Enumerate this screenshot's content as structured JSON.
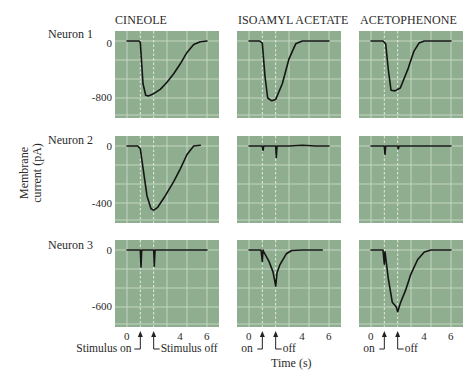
{
  "chart_data": {
    "type": "line",
    "title": "",
    "xlabel": "Time (s)",
    "ylabel": "Membrane current (pA)",
    "grid": true,
    "panel_background": "#8fae8f",
    "grid_color": "#c8d9c6",
    "trace_color": "#151515",
    "columns": [
      "CINEOLE",
      "ISOAMYL ACETATE",
      "ACETOPHENONE"
    ],
    "rows": [
      {
        "label": "Neuron 1",
        "yticks": [
          "0",
          "-800"
        ],
        "ylim": [
          -1000,
          100
        ]
      },
      {
        "label": "Neuron 2",
        "yticks": [
          "0",
          "-400"
        ],
        "ylim": [
          -500,
          50
        ]
      },
      {
        "label": "Neuron 3",
        "yticks": [
          "0",
          "-600"
        ],
        "ylim": [
          -750,
          75
        ]
      }
    ],
    "xticks": [
      "0",
      "4",
      "6"
    ],
    "xlim": [
      0,
      6.5
    ],
    "stimulus": {
      "on_s": 1.0,
      "off_s": 2.0
    },
    "panels": [
      {
        "row": "Neuron 1",
        "odor": "CINEOLE",
        "peak_pA": -760,
        "x": [
          0,
          0.9,
          1.0,
          1.2,
          1.4,
          1.6,
          2.0,
          2.5,
          3.0,
          3.5,
          4.0,
          4.5,
          5.0,
          5.5,
          6.0
        ],
        "y": [
          0,
          0,
          -20,
          -600,
          -760,
          -770,
          -740,
          -680,
          -580,
          -460,
          -320,
          -160,
          -50,
          -10,
          0
        ]
      },
      {
        "row": "Neuron 1",
        "odor": "ISOAMYL ACETATE",
        "peak_pA": -840,
        "x": [
          0,
          0.8,
          1.0,
          1.2,
          1.4,
          1.7,
          2.0,
          2.5,
          3.0,
          3.5,
          4.0,
          5.0,
          6.0
        ],
        "y": [
          0,
          0,
          -30,
          -500,
          -800,
          -840,
          -820,
          -600,
          -250,
          -40,
          0,
          0,
          0
        ]
      },
      {
        "row": "Neuron 1",
        "odor": "ACETOPHENONE",
        "peak_pA": -700,
        "x": [
          0,
          0.9,
          1.1,
          1.3,
          1.5,
          1.8,
          2.2,
          2.8,
          3.2,
          3.6,
          4.0,
          5.0,
          6.0
        ],
        "y": [
          0,
          0,
          -40,
          -400,
          -690,
          -700,
          -660,
          -380,
          -150,
          -30,
          0,
          0,
          0
        ]
      },
      {
        "row": "Neuron 2",
        "odor": "CINEOLE",
        "peak_pA": -450,
        "x": [
          0,
          0.8,
          1.0,
          1.5,
          1.8,
          2.0,
          2.3,
          2.8,
          3.5,
          4.0,
          4.5,
          5.0,
          5.5
        ],
        "y": [
          0,
          0,
          -20,
          -350,
          -440,
          -450,
          -430,
          -360,
          -250,
          -160,
          -60,
          0,
          5
        ]
      },
      {
        "row": "Neuron 2",
        "odor": "ISOAMYL ACETATE",
        "peak_pA": -80,
        "x": [
          0,
          1.0,
          1.05,
          1.1,
          2.0,
          2.05,
          2.1,
          3.0,
          4.0,
          5.0,
          6.0
        ],
        "y": [
          0,
          0,
          -30,
          0,
          0,
          -80,
          0,
          0,
          5,
          0,
          0
        ]
      },
      {
        "row": "Neuron 2",
        "odor": "ACETOPHENONE",
        "peak_pA": -60,
        "x": [
          0,
          1.0,
          1.05,
          1.1,
          2.0,
          2.05,
          2.1,
          3.0,
          4.0,
          5.0,
          6.0
        ],
        "y": [
          0,
          0,
          -60,
          0,
          0,
          -20,
          0,
          0,
          0,
          0,
          0
        ]
      },
      {
        "row": "Neuron 3",
        "odor": "CINEOLE",
        "peak_pA": -180,
        "x": [
          0,
          1.0,
          1.05,
          1.1,
          2.0,
          2.05,
          2.1,
          3.0,
          4.0,
          5.0,
          6.0
        ],
        "y": [
          0,
          0,
          -180,
          0,
          0,
          -170,
          0,
          0,
          0,
          0,
          0
        ]
      },
      {
        "row": "Neuron 3",
        "odor": "ISOAMYL ACETATE",
        "peak_pA": -380,
        "x": [
          0,
          0.9,
          1.0,
          1.05,
          1.1,
          1.5,
          1.8,
          2.0,
          2.1,
          2.3,
          2.8,
          3.2,
          4.0,
          5.0,
          5.5
        ],
        "y": [
          0,
          0,
          -120,
          0,
          -20,
          -120,
          -230,
          -380,
          -240,
          -160,
          -40,
          -5,
          0,
          0,
          0
        ]
      },
      {
        "row": "Neuron 3",
        "odor": "ACETOPHENONE",
        "peak_pA": -650,
        "x": [
          0,
          0.9,
          1.0,
          1.05,
          1.3,
          1.6,
          1.9,
          2.0,
          2.2,
          2.6,
          3.0,
          3.5,
          4.0,
          4.5,
          5.0,
          6.0
        ],
        "y": [
          0,
          0,
          -150,
          -20,
          -300,
          -550,
          -600,
          -650,
          -560,
          -420,
          -250,
          -100,
          -20,
          0,
          0,
          0
        ]
      }
    ]
  },
  "labels": {
    "col1": "CINEOLE",
    "col2": "ISOAMYL ACETATE",
    "col3": "ACETOPHENONE",
    "row1": "Neuron 1",
    "row2": "Neuron 2",
    "row3": "Neuron 3",
    "y_axis_line1": "Membrane",
    "y_axis_line2": "current (pA)",
    "x_axis": "Time (s)",
    "row1_ytick_top": "0",
    "row1_ytick_bottom": "-800",
    "row2_ytick_top": "0",
    "row2_ytick_bottom": "-400",
    "row3_ytick_top": "0",
    "row3_ytick_bottom": "-600",
    "xtick_0": "0",
    "xtick_4": "4",
    "xtick_6": "6",
    "stim_on_long": "Stimulus on",
    "stim_off_long": "Stimulus off",
    "stim_on_short": "on",
    "stim_off_short": "off"
  }
}
